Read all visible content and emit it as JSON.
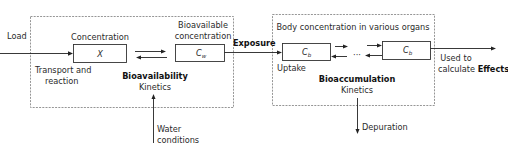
{
  "diagram": {
    "inputs": {
      "load": "Load",
      "transport_line1": "Transport and",
      "transport_line2": "reaction",
      "water_line1": "Water",
      "water_line2": "conditions"
    },
    "bioavailability_box": {
      "concentration_label": "Concentration",
      "x_box": "X",
      "bioavailable_line1": "Bioavailable",
      "bioavailable_line2": "concentration",
      "cw_main": "C",
      "cw_sub": "w",
      "title": "Bioavailability",
      "subtitle": "Kinetics"
    },
    "exposure_label": "Exposure",
    "bioaccumulation_box": {
      "header": "Body concentration in various organs",
      "cb1_main": "C",
      "cb1_sub": "b",
      "ellipsis": "···",
      "cb2_main": "C",
      "cb2_sub": "b",
      "uptake": "Uptake",
      "title": "Bioaccumulation",
      "subtitle": "Kinetics"
    },
    "outputs": {
      "effects_line1": "Used to",
      "effects_line2_prefix": "calculate ",
      "effects_line2_bold": "Effects",
      "depuration": "Depuration"
    }
  }
}
